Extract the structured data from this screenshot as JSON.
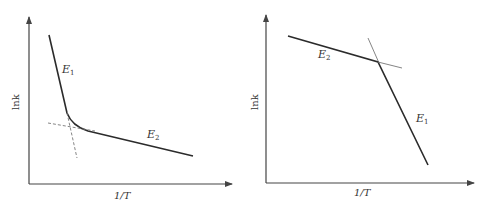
{
  "figures": [
    {
      "id": "left",
      "y_axis_label": "lnk",
      "x_axis_label": "1/T",
      "segments": [
        {
          "name": "E1",
          "label_main": "E",
          "label_sub": "1",
          "description": "steep high-temperature segment"
        },
        {
          "name": "E2",
          "label_main": "E",
          "label_sub": "2",
          "description": "shallow low-temperature segment"
        }
      ],
      "note": "curved transition with dashed extrapolated tangents"
    },
    {
      "id": "right",
      "y_axis_label": "lnk",
      "x_axis_label": "1/T",
      "segments": [
        {
          "name": "E2",
          "label_main": "E",
          "label_sub": "2",
          "description": "shallow segment"
        },
        {
          "name": "E1",
          "label_main": "E",
          "label_sub": "1",
          "description": "steep segment"
        }
      ],
      "note": "sharp break with thin extrapolated lines"
    }
  ],
  "colors": {
    "line": "#2b2b2b",
    "dashed": "#777777",
    "thin": "#666666",
    "axis": "#444444"
  }
}
